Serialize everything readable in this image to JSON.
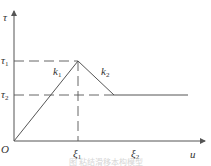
{
  "diagram": {
    "type": "bond-slip constitutive curve",
    "axes": {
      "y_label": "τ",
      "x_label": "u",
      "origin_label": "O"
    },
    "y_ticks": [
      {
        "label": "τ₁",
        "base": "τ",
        "sub": "1"
      },
      {
        "label": "τ₂",
        "base": "τ",
        "sub": "2"
      }
    ],
    "x_ticks": [
      {
        "label": "ξ₁",
        "base": "ξ",
        "sub": "1"
      },
      {
        "label": "ξ₂",
        "base": "ξ",
        "sub": "2"
      }
    ],
    "segments": [
      {
        "name": "k1",
        "label_base": "k",
        "label_sub": "1",
        "from": "O",
        "to": "(ξ₁, τ₁)"
      },
      {
        "name": "k2",
        "label_base": "k",
        "label_sub": "2",
        "from": "(ξ₁, τ₁)",
        "to": "τ₂ plateau"
      },
      {
        "name": "plateau",
        "level": "τ₂"
      }
    ],
    "caption": "图 粘结滑移本构模型",
    "colors": {
      "line": "#555555",
      "text": "#333333",
      "caption": "#d6d6d6"
    }
  }
}
